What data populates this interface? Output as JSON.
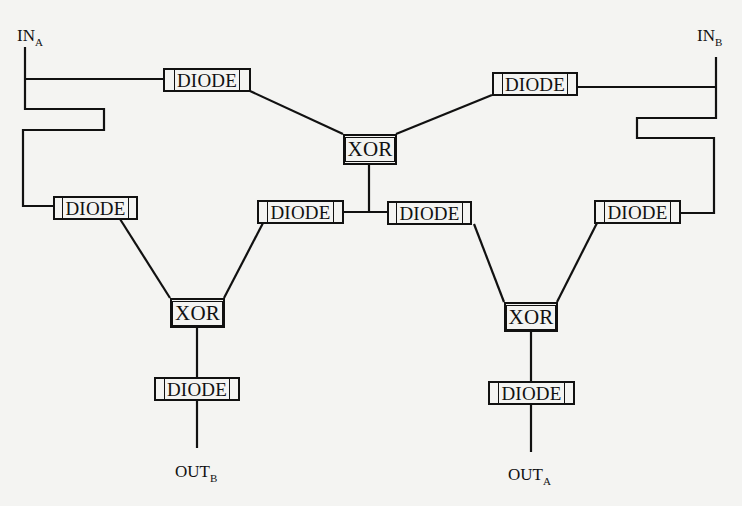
{
  "diagram": {
    "title": "",
    "inputs": [
      {
        "id": "in_a",
        "label": "IN",
        "subscript": "A"
      },
      {
        "id": "in_b",
        "label": "IN",
        "subscript": "B"
      }
    ],
    "outputs": [
      {
        "id": "out_b",
        "label": "OUT",
        "subscript": "B"
      },
      {
        "id": "out_a",
        "label": "OUT",
        "subscript": "A"
      }
    ],
    "nodes": [
      {
        "id": "diode_top_left",
        "label": "DIODE"
      },
      {
        "id": "diode_top_right",
        "label": "DIODE"
      },
      {
        "id": "xor_center",
        "label": "XOR"
      },
      {
        "id": "diode_mid_left",
        "label": "DIODE"
      },
      {
        "id": "diode_center_left",
        "label": "DIODE"
      },
      {
        "id": "diode_center_right",
        "label": "DIODE"
      },
      {
        "id": "diode_mid_right",
        "label": "DIODE"
      },
      {
        "id": "xor_left",
        "label": "XOR"
      },
      {
        "id": "xor_right",
        "label": "XOR"
      },
      {
        "id": "diode_bottom_left",
        "label": "DIODE"
      },
      {
        "id": "diode_bottom_right",
        "label": "DIODE"
      }
    ],
    "edges": [
      [
        "in_a",
        "diode_top_left"
      ],
      [
        "in_a",
        "diode_mid_left"
      ],
      [
        "in_b",
        "diode_top_right"
      ],
      [
        "in_b",
        "diode_mid_right"
      ],
      [
        "diode_top_left",
        "xor_center"
      ],
      [
        "diode_top_right",
        "xor_center"
      ],
      [
        "xor_center",
        "diode_center_left"
      ],
      [
        "xor_center",
        "diode_center_right"
      ],
      [
        "diode_mid_left",
        "xor_left"
      ],
      [
        "diode_center_left",
        "xor_left"
      ],
      [
        "diode_center_right",
        "xor_right"
      ],
      [
        "diode_mid_right",
        "xor_right"
      ],
      [
        "xor_left",
        "diode_bottom_left"
      ],
      [
        "xor_right",
        "diode_bottom_right"
      ],
      [
        "diode_bottom_left",
        "out_b"
      ],
      [
        "diode_bottom_right",
        "out_a"
      ]
    ],
    "colors": {
      "line": "#111111",
      "background": "#f4f4f2"
    }
  }
}
